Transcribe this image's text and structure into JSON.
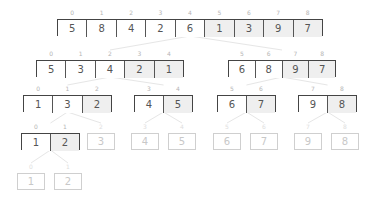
{
  "diagram": {
    "colors": {
      "border": "#444444",
      "text": "#555555",
      "shade": "#efefef",
      "faded_border": "#cfcfcf",
      "faded_text": "#c8c8c8",
      "index": "#b5b5b5",
      "connector": "#e6e6e6"
    },
    "levels": [
      {
        "name": "level-0",
        "arrays": [
          {
            "x": 57,
            "y": 19,
            "w": 266,
            "faded": false,
            "cells": [
              {
                "i": "0",
                "v": "5",
                "s": false
              },
              {
                "i": "1",
                "v": "8",
                "s": false
              },
              {
                "i": "2",
                "v": "4",
                "s": false
              },
              {
                "i": "3",
                "v": "2",
                "s": false
              },
              {
                "i": "4",
                "v": "6",
                "s": false
              },
              {
                "i": "5",
                "v": "1",
                "s": true
              },
              {
                "i": "6",
                "v": "3",
                "s": true
              },
              {
                "i": "7",
                "v": "9",
                "s": true
              },
              {
                "i": "8",
                "v": "7",
                "s": true
              }
            ]
          }
        ]
      },
      {
        "name": "level-1",
        "arrays": [
          {
            "x": 36,
            "y": 60,
            "w": 148,
            "faded": false,
            "cells": [
              {
                "i": "0",
                "v": "5",
                "s": false
              },
              {
                "i": "1",
                "v": "3",
                "s": false
              },
              {
                "i": "2",
                "v": "4",
                "s": false
              },
              {
                "i": "3",
                "v": "2",
                "s": true
              },
              {
                "i": "4",
                "v": "1",
                "s": true
              }
            ]
          },
          {
            "x": 228,
            "y": 60,
            "w": 108,
            "faded": false,
            "cells": [
              {
                "i": "5",
                "v": "6",
                "s": false
              },
              {
                "i": "6",
                "v": "8",
                "s": false
              },
              {
                "i": "7",
                "v": "9",
                "s": true
              },
              {
                "i": "8",
                "v": "7",
                "s": true
              }
            ]
          }
        ]
      },
      {
        "name": "level-2",
        "arrays": [
          {
            "x": 23,
            "y": 95,
            "w": 89,
            "faded": false,
            "cells": [
              {
                "i": "0",
                "v": "1",
                "s": false
              },
              {
                "i": "1",
                "v": "3",
                "s": false
              },
              {
                "i": "2",
                "v": "2",
                "s": true
              }
            ]
          },
          {
            "x": 134,
            "y": 95,
            "w": 59,
            "faded": false,
            "cells": [
              {
                "i": "3",
                "v": "4",
                "s": false
              },
              {
                "i": "4",
                "v": "5",
                "s": true
              }
            ]
          },
          {
            "x": 217,
            "y": 95,
            "w": 59,
            "faded": false,
            "cells": [
              {
                "i": "5",
                "v": "6",
                "s": false
              },
              {
                "i": "6",
                "v": "7",
                "s": true
              }
            ]
          },
          {
            "x": 298,
            "y": 95,
            "w": 59,
            "faded": false,
            "cells": [
              {
                "i": "7",
                "v": "9",
                "s": false
              },
              {
                "i": "8",
                "v": "8",
                "s": true
              }
            ]
          }
        ]
      },
      {
        "name": "level-3",
        "arrays": [
          {
            "x": 21,
            "y": 133,
            "w": 59,
            "faded": false,
            "cells": [
              {
                "i": "0",
                "v": "1",
                "s": false
              },
              {
                "i": "1",
                "v": "2",
                "s": true
              }
            ]
          },
          {
            "x": 87,
            "y": 133,
            "w": 28,
            "faded": true,
            "cells": [
              {
                "i": "2",
                "v": "3",
                "s": false
              }
            ]
          },
          {
            "x": 131,
            "y": 133,
            "w": 28,
            "faded": true,
            "cells": [
              {
                "i": "3",
                "v": "4",
                "s": false
              }
            ]
          },
          {
            "x": 168,
            "y": 133,
            "w": 28,
            "faded": true,
            "cells": [
              {
                "i": "4",
                "v": "5",
                "s": false
              }
            ]
          },
          {
            "x": 213,
            "y": 133,
            "w": 28,
            "faded": true,
            "cells": [
              {
                "i": "5",
                "v": "6",
                "s": false
              }
            ]
          },
          {
            "x": 250,
            "y": 133,
            "w": 28,
            "faded": true,
            "cells": [
              {
                "i": "6",
                "v": "7",
                "s": false
              }
            ]
          },
          {
            "x": 294,
            "y": 133,
            "w": 28,
            "faded": true,
            "cells": [
              {
                "i": "7",
                "v": "9",
                "s": false
              }
            ]
          },
          {
            "x": 331,
            "y": 133,
            "w": 28,
            "faded": true,
            "cells": [
              {
                "i": "8",
                "v": "8",
                "s": false
              }
            ]
          }
        ]
      },
      {
        "name": "level-4",
        "arrays": [
          {
            "x": 17,
            "y": 173,
            "w": 28,
            "faded": true,
            "cells": [
              {
                "i": "0",
                "v": "1",
                "s": false
              }
            ]
          },
          {
            "x": 54,
            "y": 173,
            "w": 28,
            "faded": true,
            "cells": [
              {
                "i": "1",
                "v": "2",
                "s": false
              }
            ]
          }
        ]
      }
    ]
  }
}
